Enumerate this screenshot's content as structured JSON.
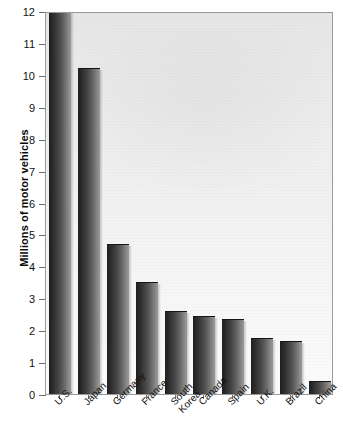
{
  "chart_data": {
    "type": "bar",
    "title": "",
    "xlabel": "",
    "ylabel": "Millions of motor vehicles",
    "categories": [
      "U.S.",
      "Japan",
      "Germany",
      "France",
      "South\nKorea",
      "Canada",
      "Spain",
      "U.K.",
      "Brazil",
      "China"
    ],
    "values": [
      12.0,
      10.2,
      4.7,
      3.5,
      2.6,
      2.45,
      2.35,
      1.75,
      1.65,
      0.4
    ],
    "ylim": [
      0,
      12
    ],
    "yticks": [
      0,
      1,
      2,
      3,
      4,
      5,
      6,
      7,
      8,
      9,
      10,
      11,
      12
    ],
    "ytick_labels": [
      "0",
      "1",
      "2",
      "3",
      "4",
      "5",
      "6",
      "7",
      "8",
      "9",
      "10",
      "11",
      "12"
    ],
    "grid": false,
    "legend": null,
    "bar_color": "#3a3a3a",
    "plot_background": "#efefef",
    "axis_color": "#9a9a9a",
    "text_color": "#111111"
  },
  "axis": {
    "y_title": "Millions of motor vehicles"
  }
}
